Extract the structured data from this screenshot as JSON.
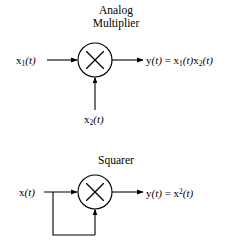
{
  "figure": {
    "background_color": "#ffffff",
    "line_color": "#000000",
    "width": 232,
    "height": 243
  },
  "diagram_multiplier": {
    "title_line1": "Analog",
    "title_line2": "Multiplier",
    "operator_symbol": "×",
    "input_top_label_main": "x",
    "input_top_label_sub": "1",
    "input_top_label_arg": "(t)",
    "input_bottom_label_main": "x",
    "input_bottom_label_sub": "2",
    "input_bottom_label_arg": "(t)",
    "output_label_y": "y",
    "output_label_y_arg": "(t)",
    "output_label_equals": " = ",
    "output_label_expr_a_main": "x",
    "output_label_expr_a_sub": "1",
    "output_label_expr_a_arg": "(t)",
    "output_label_expr_b_main": "x",
    "output_label_expr_b_sub": "2",
    "output_label_expr_b_arg": "(t)"
  },
  "diagram_squarer": {
    "title": "Squarer",
    "operator_symbol": "×",
    "input_label_main": "x",
    "input_label_arg": "(t)",
    "output_label_y": "y",
    "output_label_y_arg": "(t)",
    "output_label_equals": " = ",
    "output_label_expr_main": "x",
    "output_label_expr_sup": "2",
    "output_label_expr_arg": "(t)"
  }
}
